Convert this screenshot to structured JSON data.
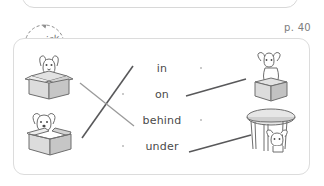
{
  "page": {
    "page_label": "p. 40",
    "badge_line1": "Quick",
    "badge_line2": "Check-Up"
  },
  "colors": {
    "card_border": "#dcdcdc",
    "text": "#4a4a4a",
    "page_number": "#7d7d7d",
    "line_dark": "#58585a",
    "line_light": "#9a9a9a",
    "dot": "#b9b9b9",
    "illustration_stroke": "#6e6e6e",
    "illustration_fill": "#d5d5d5"
  },
  "exercise": {
    "instruction_type": "matching",
    "words": [
      {
        "label": "in",
        "dot_left": false,
        "dot_right": true
      },
      {
        "label": "on",
        "dot_left": true,
        "dot_right": false
      },
      {
        "label": "behind",
        "dot_left": false,
        "dot_right": true
      },
      {
        "label": "under",
        "dot_left": true,
        "dot_right": false
      }
    ],
    "pictures_left": [
      {
        "name": "dog-in-closed-box",
        "alt": "dog peeking out of a closed box"
      },
      {
        "name": "dog-in-open-box",
        "alt": "dog sitting inside an open box"
      }
    ],
    "pictures_right": [
      {
        "name": "dog-on-box",
        "alt": "dog sitting on top of a box"
      },
      {
        "name": "dog-under-table",
        "alt": "dog under a round table"
      }
    ],
    "connections": [
      {
        "from": "dog-in-open-box",
        "to": "in",
        "style": "dark"
      },
      {
        "from": "dog-in-closed-box",
        "to": "behind",
        "style": "light"
      },
      {
        "from": "on",
        "to": "dog-on-box",
        "style": "dark"
      },
      {
        "from": "under",
        "to": "dog-under-table",
        "style": "dark"
      }
    ]
  }
}
